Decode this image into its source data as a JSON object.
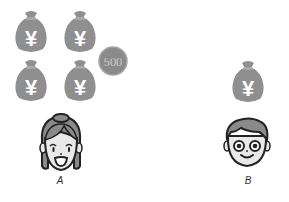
{
  "colors": {
    "bag": "#8f8f8f",
    "coin": "#8a8a8a",
    "coin_rim": "#a5a5a5",
    "symbol": "#ffffff",
    "outline": "#222222",
    "hair": "#8a8a8a",
    "skin": "#e9e9e9"
  },
  "person_a": {
    "label": "A",
    "money_bags": [
      {
        "symbol": "¥"
      },
      {
        "symbol": "¥"
      },
      {
        "symbol": "¥"
      },
      {
        "symbol": "¥"
      }
    ],
    "coins": [
      {
        "value": "500"
      }
    ]
  },
  "person_b": {
    "label": "B",
    "money_bags": [
      {
        "symbol": "¥"
      }
    ]
  }
}
